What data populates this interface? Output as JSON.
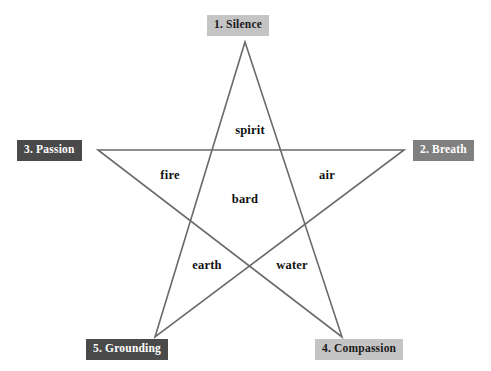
{
  "diagram": {
    "background_color": "#ffffff",
    "line_color": "#6a6a6a",
    "line_width": 1.6,
    "star": {
      "shape": "pentagram",
      "vertices": [
        {
          "name": "top",
          "x": 245,
          "y": 42
        },
        {
          "name": "right",
          "x": 404,
          "y": 150
        },
        {
          "name": "bottom-right",
          "x": 342,
          "y": 337
        },
        {
          "name": "bottom-left",
          "x": 155,
          "y": 337
        },
        {
          "name": "left",
          "x": 98,
          "y": 150
        }
      ],
      "path_order": [
        "top",
        "bottom-right",
        "left",
        "right",
        "bottom-left",
        "top"
      ]
    },
    "point_labels": [
      {
        "id": "silence",
        "text": "1. Silence",
        "position": "top",
        "background_color": "#c4c4c4",
        "text_color": "#1a1a1a"
      },
      {
        "id": "breath",
        "text": "2. Breath",
        "position": "right",
        "background_color": "#808080",
        "text_color": "#ffffff"
      },
      {
        "id": "passion",
        "text": "3. Passion",
        "position": "left",
        "background_color": "#4a4a4a",
        "text_color": "#ffffff"
      },
      {
        "id": "compassion",
        "text": "4. Compassion",
        "position": "bottom-right",
        "background_color": "#c4c4c4",
        "text_color": "#1a1a1a"
      },
      {
        "id": "grounding",
        "text": "5. Grounding",
        "position": "bottom-left",
        "background_color": "#4a4a4a",
        "text_color": "#ffffff"
      }
    ],
    "element_labels": [
      {
        "id": "spirit",
        "text": "spirit",
        "region": "top-point-interior"
      },
      {
        "id": "fire",
        "text": "fire",
        "region": "left-upper-interior"
      },
      {
        "id": "air",
        "text": "air",
        "region": "right-upper-interior"
      },
      {
        "id": "bard",
        "text": "bard",
        "region": "center-pentagon"
      },
      {
        "id": "earth",
        "text": "earth",
        "region": "left-lower-interior"
      },
      {
        "id": "water",
        "text": "water",
        "region": "right-lower-interior"
      }
    ]
  }
}
